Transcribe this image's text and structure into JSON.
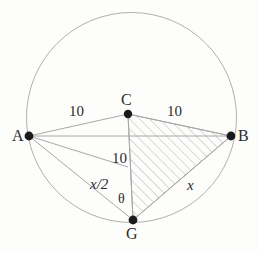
{
  "figure": {
    "background_color": "#fdfdfc",
    "stroke_color": "#a9a9a9",
    "vertex_color": "#1a1a1a",
    "hatch_color": "#b5b5b5"
  },
  "circle": {
    "center": {
      "x": 131.5,
      "y": 117.5
    },
    "radius": 105
  },
  "points": {
    "A": {
      "label": "A",
      "x": 29,
      "y": 136,
      "label_x": 12,
      "label_y": 128
    },
    "B": {
      "label": "B",
      "x": 231,
      "y": 136,
      "label_x": 238,
      "label_y": 128
    },
    "C": {
      "label": "C",
      "x": 128,
      "y": 114,
      "label_x": 121,
      "label_y": 92
    },
    "G": {
      "label": "G",
      "x": 133,
      "y": 220,
      "label_x": 126,
      "label_y": 226
    },
    "M": {
      "x": 128,
      "y": 167
    }
  },
  "labels": {
    "ac_length": {
      "text": "10",
      "x": 69,
      "y": 104
    },
    "cb_length": {
      "text": "10",
      "x": 167,
      "y": 104
    },
    "cg_length": {
      "text": "10",
      "x": 112,
      "y": 151
    },
    "half_x": {
      "text": "x/2",
      "x": 90,
      "y": 177
    },
    "x_side": {
      "text": "x",
      "x": 187,
      "y": 178
    },
    "theta": {
      "text": "θ",
      "x": 118,
      "y": 192
    }
  },
  "segments": [
    {
      "name": "segment-A-C",
      "from": "A",
      "to": "C"
    },
    {
      "name": "segment-C-B",
      "from": "C",
      "to": "B"
    },
    {
      "name": "segment-A-B-chord",
      "from": "A",
      "to": "B"
    },
    {
      "name": "segment-C-G",
      "from": "C",
      "to": "G"
    },
    {
      "name": "segment-A-G",
      "from": "A",
      "to": "G"
    },
    {
      "name": "segment-G-B",
      "from": "G",
      "to": "B"
    },
    {
      "name": "segment-A-M",
      "from": "A",
      "to": "M"
    }
  ],
  "shaded_region": {
    "name": "triangle-C-G-B",
    "vertices": [
      "C",
      "G",
      "B"
    ],
    "fill": "diagonal-hatch"
  }
}
